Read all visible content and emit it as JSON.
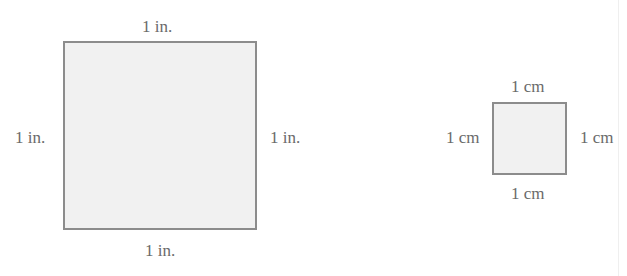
{
  "figure": {
    "large_square": {
      "unit": "in.",
      "labels": {
        "top": "1 in.",
        "left": "1 in.",
        "right": "1 in.",
        "bottom": "1 in."
      },
      "fill": "#f1f1f1",
      "stroke": "#8c8c8c"
    },
    "small_square": {
      "unit": "cm",
      "labels": {
        "top": "1 cm",
        "left": "1 cm",
        "right": "1 cm",
        "bottom": "1 cm"
      },
      "fill": "#f1f1f1",
      "stroke": "#8c8c8c"
    }
  }
}
